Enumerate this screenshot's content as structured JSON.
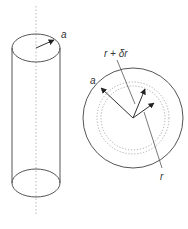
{
  "diagram": {
    "cylinder": {
      "radius_label": "a"
    },
    "cross_section": {
      "outer_radius_label": "a",
      "shell_outer_label": "r + δr",
      "shell_inner_label": "r"
    },
    "colors": {
      "stroke": "#555555",
      "axis": "#bbbbbb",
      "dotted_circle": "#aaaaaa",
      "text": "#333333"
    }
  }
}
